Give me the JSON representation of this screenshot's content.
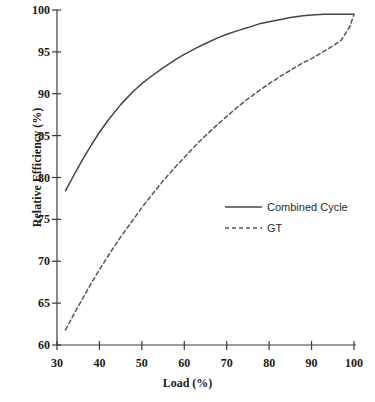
{
  "chart_data": {
    "type": "line",
    "title": "",
    "xlabel": "Load (%)",
    "ylabel": "Relative Efficiency (%)",
    "xlim": [
      30,
      100
    ],
    "ylim": [
      60,
      100
    ],
    "xticks": [
      30,
      40,
      50,
      60,
      70,
      80,
      90,
      100
    ],
    "yticks": [
      60,
      65,
      70,
      75,
      80,
      85,
      90,
      95,
      100
    ],
    "xtick_labels": [
      "30",
      "40",
      "50",
      "60",
      "70",
      "80",
      "90",
      "100"
    ],
    "ytick_labels": [
      "60",
      "65",
      "70",
      "75",
      "80",
      "85",
      "90",
      "95",
      "100"
    ],
    "grid": false,
    "legend_position": "center-right-inside",
    "series": [
      {
        "name": "Combined Cycle",
        "style": "solid",
        "color": "#444444",
        "x": [
          32,
          34,
          36,
          38,
          40,
          42,
          45,
          48,
          50,
          52,
          55,
          58,
          60,
          63,
          65,
          68,
          70,
          73,
          75,
          78,
          80,
          83,
          85,
          88,
          90,
          93,
          95,
          97,
          99,
          100
        ],
        "y": [
          78.4,
          80.3,
          82.1,
          83.8,
          85.4,
          86.8,
          88.7,
          90.3,
          91.2,
          92.0,
          93.1,
          94.1,
          94.7,
          95.5,
          96.0,
          96.7,
          97.1,
          97.6,
          97.9,
          98.4,
          98.6,
          98.9,
          99.1,
          99.3,
          99.4,
          99.5,
          99.5,
          99.5,
          99.5,
          99.5
        ]
      },
      {
        "name": "GT",
        "style": "dashed",
        "color": "#555555",
        "x": [
          32,
          34,
          36,
          38,
          40,
          42,
          45,
          48,
          50,
          52,
          55,
          58,
          60,
          63,
          65,
          68,
          70,
          73,
          75,
          78,
          80,
          83,
          85,
          88,
          90,
          93,
          95,
          97,
          99,
          100
        ],
        "y": [
          61.8,
          63.7,
          65.5,
          67.3,
          69.0,
          70.6,
          72.9,
          75.0,
          76.4,
          77.7,
          79.6,
          81.3,
          82.4,
          84.0,
          85.0,
          86.4,
          87.3,
          88.6,
          89.4,
          90.5,
          91.2,
          92.2,
          92.8,
          93.7,
          94.2,
          95.1,
          95.7,
          96.4,
          98.0,
          99.5
        ]
      }
    ],
    "legend": [
      {
        "label": "Combined Cycle",
        "style": "solid"
      },
      {
        "label": "GT",
        "style": "dashed"
      }
    ],
    "axis_color": "#3a3a3a",
    "text_color": "#1a1a1a"
  }
}
